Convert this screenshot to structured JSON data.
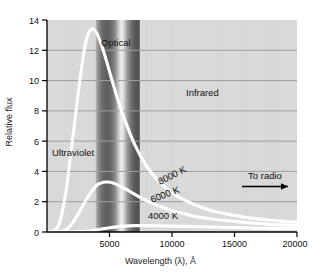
{
  "chart_data": {
    "type": "line",
    "title": "",
    "xlabel": "Wavelength (λ), Å",
    "ylabel": "Relative flux",
    "xlim": [
      0,
      20000
    ],
    "ylim": [
      0,
      14
    ],
    "xticks": [
      0,
      5000,
      10000,
      15000,
      20000
    ],
    "xticklabels": [
      "",
      "5000",
      "10000",
      "15000",
      "20000"
    ],
    "yticks": [
      0,
      2,
      4,
      6,
      8,
      10,
      12,
      14
    ],
    "yticklabels": [
      "0",
      "2",
      "4",
      "6",
      "8",
      "10",
      "12",
      "14"
    ],
    "grid": "horizontal",
    "legend": "inline-curve-labels",
    "series": [
      {
        "name": "8000 K",
        "label": "8000 K",
        "peak_x": 3700,
        "peak_y": 13.4,
        "x": [
          0,
          500,
          1000,
          1500,
          2000,
          2500,
          3000,
          3300,
          3600,
          3700,
          4000,
          4500,
          5000,
          5500,
          6000,
          7000,
          8000,
          9000,
          10000,
          11000,
          12000,
          13000,
          14000,
          15000,
          16000,
          17000,
          18000,
          19000,
          20000
        ],
        "y": [
          0,
          0.05,
          0.6,
          2.6,
          5.8,
          9.2,
          12.1,
          13.1,
          13.4,
          13.4,
          13.1,
          12.0,
          10.6,
          9.2,
          7.9,
          5.8,
          4.3,
          3.3,
          2.6,
          2.1,
          1.75,
          1.45,
          1.25,
          1.1,
          0.95,
          0.85,
          0.78,
          0.7,
          0.65
        ]
      },
      {
        "name": "6000 K",
        "label": "6000 K",
        "peak_x": 4900,
        "peak_y": 3.3,
        "x": [
          0,
          500,
          1000,
          1500,
          2000,
          2500,
          3000,
          3500,
          4000,
          4500,
          4900,
          5400,
          6000,
          6500,
          7000,
          8000,
          9000,
          10000,
          11000,
          12000,
          13000,
          14000,
          15000,
          16000,
          17000,
          18000,
          19000,
          20000
        ],
        "y": [
          0,
          0.0,
          0.02,
          0.15,
          0.55,
          1.2,
          1.95,
          2.6,
          3.1,
          3.28,
          3.3,
          3.2,
          2.95,
          2.75,
          2.5,
          2.05,
          1.7,
          1.4,
          1.2,
          1.0,
          0.88,
          0.78,
          0.7,
          0.62,
          0.56,
          0.5,
          0.46,
          0.42
        ]
      },
      {
        "name": "4000 K",
        "label": "4000 K",
        "peak_x": 7200,
        "peak_y": 0.42,
        "x": [
          0,
          1000,
          2000,
          3000,
          4000,
          5000,
          6000,
          7200,
          8000,
          9000,
          10000,
          11000,
          12000,
          13000,
          14000,
          15000,
          16000,
          17000,
          18000,
          19000,
          20000
        ],
        "y": [
          0,
          0.0,
          0.01,
          0.05,
          0.15,
          0.28,
          0.37,
          0.42,
          0.42,
          0.41,
          0.39,
          0.37,
          0.35,
          0.33,
          0.31,
          0.29,
          0.27,
          0.25,
          0.24,
          0.22,
          0.21
        ]
      }
    ],
    "bands": [
      {
        "name": "optical",
        "label": "Optical",
        "x_start": 3900,
        "x_end": 7400
      }
    ],
    "annotations": [
      {
        "name": "ultraviolet",
        "text": "Ultraviolet"
      },
      {
        "name": "infrared",
        "text": "Infrared"
      },
      {
        "name": "to-radio",
        "text": "To radio"
      }
    ],
    "colors": {
      "curve": "#ffffff",
      "plot_background": "#d8d8d8",
      "gridline": "#9a9a9a",
      "axis": "#000000",
      "text": "#111111",
      "arrow": "#000000"
    }
  },
  "axes": {
    "x_title": "Wavelength (λ), Å",
    "y_title": "Relative flux"
  },
  "labels": {
    "optical": "Optical",
    "ultraviolet": "Ultraviolet",
    "infrared": "Infrared",
    "to_radio": "To radio",
    "t8000": "8000 K",
    "t6000": "6000 K",
    "t4000": "4000 K"
  },
  "ticks": {
    "x": [
      "5000",
      "10000",
      "15000",
      "20000"
    ],
    "y": [
      "14",
      "12",
      "10",
      "8",
      "6",
      "4",
      "2",
      "0"
    ]
  }
}
